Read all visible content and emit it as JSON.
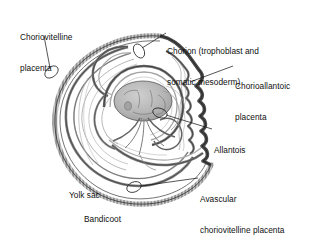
{
  "figure": {
    "caption": "Bandicoot",
    "background_color": "#ffffff",
    "ink_color": "#1a1a1a",
    "membrane_color": "#8c8c8c",
    "embryo_fill": "#b4b4b4"
  },
  "labels": [
    {
      "id": "choriovitelline-placenta",
      "line1": "Choriovitelline",
      "line2": "placenta",
      "x": 20,
      "y": 12
    },
    {
      "id": "chorion",
      "line1": "Chorion (trophoblast and",
      "line2": "somatic mesoderm)",
      "x": 167,
      "y": 26
    },
    {
      "id": "chorioallantoic-placenta",
      "line1": "Chorioallantoic",
      "line2": "placenta",
      "x": 235,
      "y": 61
    },
    {
      "id": "allantois",
      "line1": "Allantois",
      "line2": "",
      "x": 214,
      "y": 125
    },
    {
      "id": "avascular-choriovitelline-placenta",
      "line1": "Avascular",
      "line2": "choriovitelline placenta",
      "x": 200,
      "y": 174
    },
    {
      "id": "yolk-sac",
      "line1": "Yolk sac",
      "line2": "",
      "x": 69,
      "y": 170
    }
  ],
  "caption_label": {
    "text": "Bandicoot",
    "x": 84,
    "y": 214
  },
  "structures": [
    {
      "name": "chorion-trophoblast-outer-wall"
    },
    {
      "name": "choriovitelline-placenta-region"
    },
    {
      "name": "chorioallantoic-placenta-scalloped-region"
    },
    {
      "name": "allantois-sac"
    },
    {
      "name": "yolk-sac-cavity"
    },
    {
      "name": "embryo"
    },
    {
      "name": "amnion"
    },
    {
      "name": "avascular-choriovitelline-region"
    }
  ]
}
